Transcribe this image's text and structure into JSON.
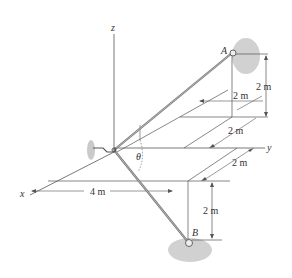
{
  "figure": {
    "axes": {
      "x": "x",
      "y": "y",
      "z": "z"
    },
    "points": {
      "A": "A",
      "B": "B"
    },
    "angle": "θ",
    "dimensions": {
      "a_height": "2 m",
      "a_offset_upper": "2 m",
      "a_offset_lower": "2 m",
      "b_offset_y": "2 m",
      "b_depth": "2 m",
      "x_distance": "4 m"
    },
    "colors": {
      "line": "#555555",
      "rod": "#888888",
      "support": "#bbbbbb"
    }
  }
}
